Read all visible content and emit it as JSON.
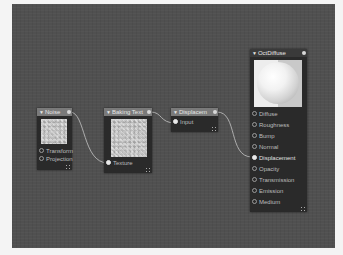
{
  "editor": {
    "type": "node-editor",
    "canvas_color": "#505050"
  },
  "nodes": {
    "noise": {
      "title": "Noise",
      "inputs": [
        "Transform",
        "Projection"
      ]
    },
    "baking": {
      "title": "Baking Text",
      "inputs": [
        "Texture"
      ]
    },
    "displacement": {
      "title": "Displacem",
      "inputs": [
        "Input"
      ]
    },
    "octdiffuse": {
      "title": "OctDiffuse",
      "inputs": [
        "Diffuse",
        "Roughness",
        "Bump",
        "Normal",
        "Displacement",
        "Opacity",
        "Transmission",
        "Emission",
        "Medium"
      ]
    }
  },
  "connections": [
    {
      "from": "Noise",
      "to": "Baking Text.Texture"
    },
    {
      "from": "Baking Text",
      "to": "Displacem.Input"
    },
    {
      "from": "Displacem",
      "to": "OctDiffuse.Displacement"
    }
  ],
  "icons": {
    "collapse": "▼",
    "port": "○",
    "resize": "⠿"
  }
}
